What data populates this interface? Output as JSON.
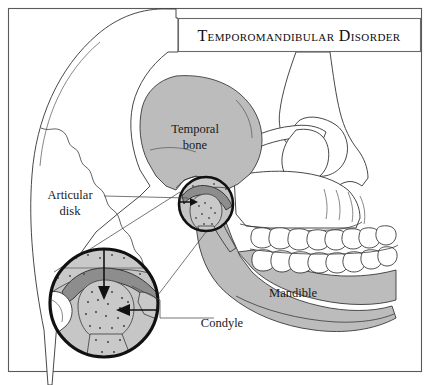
{
  "figure": {
    "title": "Temporomandibular Disorder",
    "kind": "anatomical-illustration",
    "view": "lateral skull profile facing right"
  },
  "title_box": {
    "label": "Temporomandibular Disorder",
    "x": 178,
    "y": 18,
    "width": 243,
    "height": 34
  },
  "labels": [
    {
      "id": "temporal-bone",
      "line1": "Temporal",
      "line2": "bone",
      "x": 195,
      "y": 133,
      "align": "middle",
      "leader": false
    },
    {
      "id": "articular-disk",
      "line1": "Articular",
      "line2": "disk",
      "x": 70,
      "y": 199,
      "align": "middle",
      "leader": true
    },
    {
      "id": "mandible",
      "line1": "Mandible",
      "line2": "",
      "x": 293,
      "y": 297,
      "align": "middle",
      "leader": false
    },
    {
      "id": "condyle",
      "line1": "Condyle",
      "line2": "",
      "x": 222,
      "y": 327,
      "align": "middle",
      "leader": true
    }
  ],
  "callout": {
    "source_circle": {
      "cx": 206,
      "cy": 204,
      "r": 28
    },
    "magnified_circle": {
      "cx": 104,
      "cy": 303,
      "r": 55
    },
    "connector_left": {
      "x1": 178,
      "y1": 204,
      "x2": 52,
      "y2": 290
    },
    "connector_right": {
      "x1": 206,
      "y1": 232,
      "x2": 104,
      "y2": 358
    }
  },
  "colors": {
    "bone_gray": "#bcbcbc",
    "bone_gray_light": "#c9c9c9",
    "disk_dark": "#8d8d8d",
    "outline": "#333333",
    "frame": "#5a5a5a",
    "background": "#ffffff",
    "ink": "#111111"
  },
  "frame": {
    "x": 8,
    "y": 8,
    "width": 414,
    "height": 364
  }
}
